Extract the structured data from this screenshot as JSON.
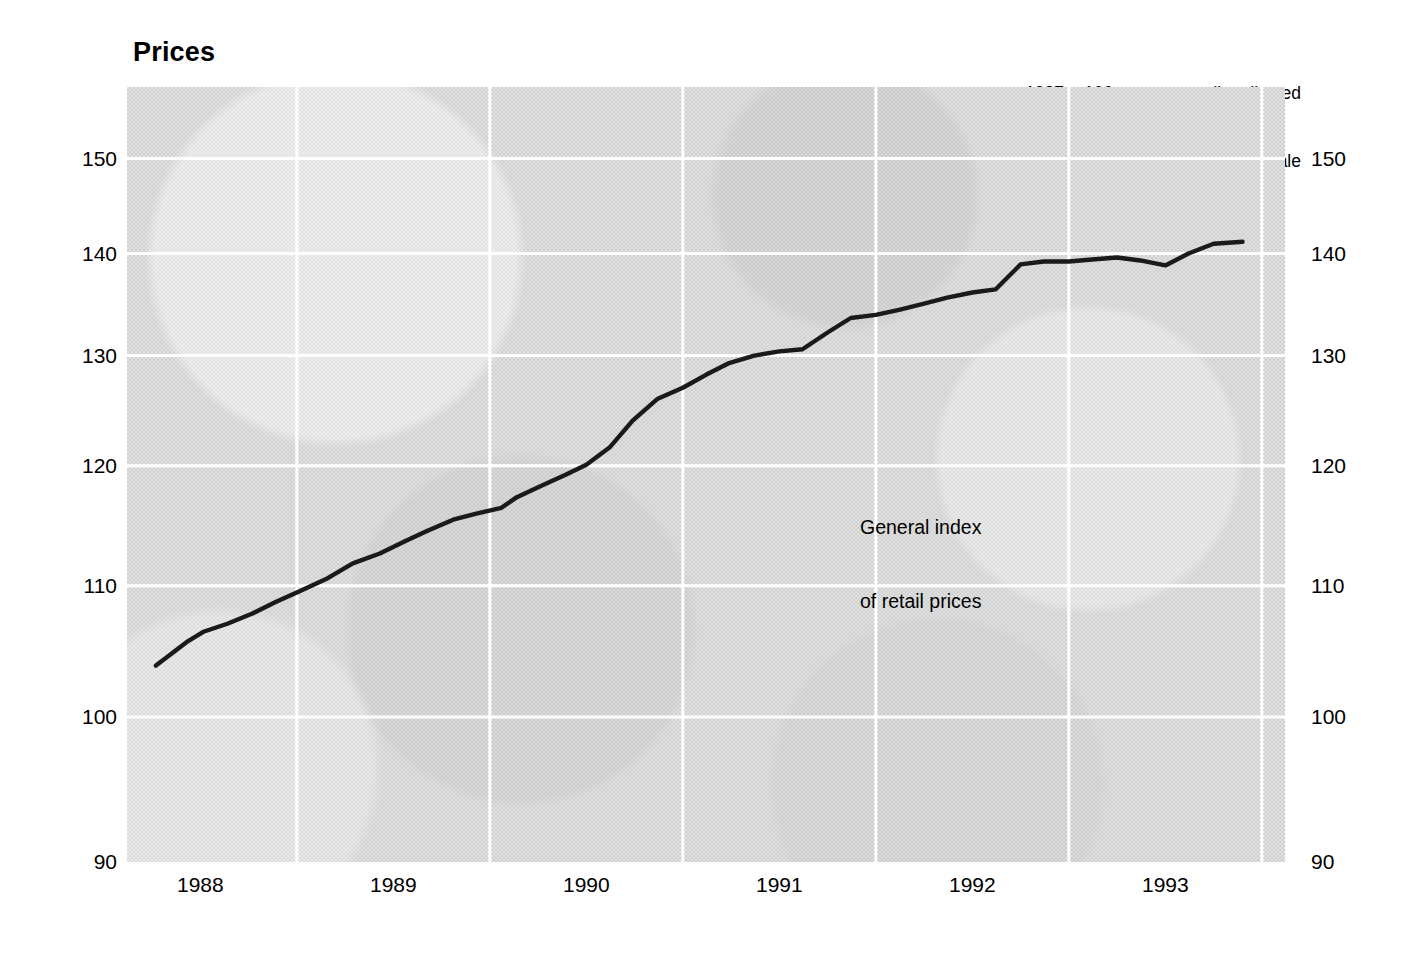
{
  "title": "Prices",
  "note": {
    "line1": "1987 = 100 not seasonally adjusted",
    "line2": "log scale"
  },
  "series_label": {
    "line1": "General index",
    "line2": "of retail prices"
  },
  "colors": {
    "plot_background": "#d6d6d6",
    "gridline": "#ffffff",
    "series_line": "#1a1a1a",
    "text": "#000000"
  },
  "chart_data": {
    "type": "line",
    "title": "Prices",
    "subtitle": "1987 = 100 not seasonally adjusted, log scale",
    "xlabel": "",
    "ylabel": "",
    "yscale": "log",
    "ylim": [
      90,
      158
    ],
    "xlim": [
      1987.62,
      1993.62
    ],
    "grid": true,
    "legend": "none",
    "y_ticks": [
      150,
      140,
      130,
      120,
      110,
      100,
      90
    ],
    "x_ticks": [
      1988,
      1989,
      1990,
      1991,
      1992,
      1993
    ],
    "x_tick_positions": [
      1988.0,
      1989.0,
      1990.0,
      1991.0,
      1992.0,
      1993.0
    ],
    "x_gridlines": [
      1988.5,
      1989.5,
      1990.5,
      1991.5,
      1992.5,
      1993.5
    ],
    "series": [
      {
        "name": "General index of retail prices",
        "x": [
          1987.77,
          1987.93,
          1988.02,
          1988.14,
          1988.27,
          1988.39,
          1988.52,
          1988.66,
          1988.79,
          1988.93,
          1989.06,
          1989.18,
          1989.31,
          1989.43,
          1989.56,
          1989.64,
          1989.77,
          1989.89,
          1990.0,
          1990.12,
          1990.24,
          1990.37,
          1990.5,
          1990.62,
          1990.74,
          1990.87,
          1991.0,
          1991.12,
          1991.25,
          1991.37,
          1991.5,
          1991.62,
          1991.75,
          1991.87,
          1992.0,
          1992.12,
          1992.25,
          1992.37,
          1992.5,
          1992.62,
          1992.75,
          1992.87,
          1993.0,
          1993.12,
          1993.25,
          1993.4
        ],
        "y": [
          103.8,
          105.6,
          106.4,
          107.0,
          107.8,
          108.7,
          109.6,
          110.6,
          111.8,
          112.6,
          113.6,
          114.5,
          115.4,
          115.9,
          116.4,
          117.3,
          118.3,
          119.2,
          120.1,
          121.6,
          124.0,
          126.0,
          127.0,
          128.2,
          129.3,
          130.0,
          130.4,
          130.6,
          132.2,
          133.6,
          133.9,
          134.4,
          135.0,
          135.6,
          136.1,
          136.4,
          138.9,
          139.2,
          139.2,
          139.4,
          139.6,
          139.3,
          138.8,
          140.0,
          141.0,
          141.2
        ]
      }
    ]
  }
}
